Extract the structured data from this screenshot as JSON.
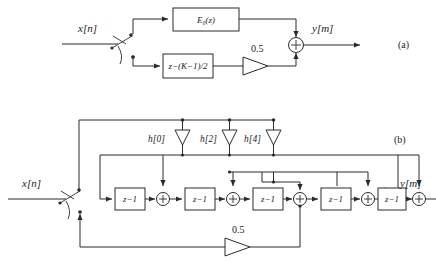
{
  "figure": {
    "panels": [
      {
        "id": "a",
        "label": "(a)",
        "input_label": "x[n]",
        "output_label": "y[m]",
        "blocks": [
          {
            "name": "polyphase-branch",
            "label": "E₀(z)"
          },
          {
            "name": "delay-branch",
            "label": "z−(K−1)/2"
          }
        ],
        "gain_label": "0.5",
        "adder_symbol": "+",
        "switch_name": "commutator-switch"
      },
      {
        "id": "b",
        "label": "(b)",
        "input_label": "x[n]",
        "output_label": "y[m]",
        "delay_label": "z−1",
        "delay_count": 5,
        "adder_count": 5,
        "adder_symbol": "+",
        "taps": [
          {
            "label": "h[0]"
          },
          {
            "label": "h[2]"
          },
          {
            "label": "h[4]"
          }
        ],
        "gain_label": "0.5",
        "switch_name": "commutator-switch"
      }
    ]
  },
  "colors": {
    "ink": "#2b2b2b",
    "background": "#ffffff"
  }
}
